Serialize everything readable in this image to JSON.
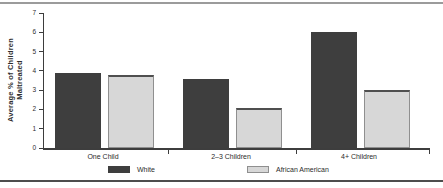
{
  "chart_data": {
    "type": "bar",
    "title": "",
    "categories": [
      "One Child",
      "2–3 Children",
      "4+ Children"
    ],
    "series": [
      {
        "name": "White",
        "values": [
          3.9,
          3.6,
          6.0
        ],
        "color": "#3e3e3e"
      },
      {
        "name": "African American",
        "values": [
          3.8,
          2.1,
          3.0
        ],
        "color": "#d7d7d7"
      }
    ],
    "xlabel": "",
    "ylabel": "Average % of Children Maltreated",
    "ylabel_line1": "Average % of Children",
    "ylabel_line2": "Maltreated",
    "ylim": [
      0,
      7
    ],
    "yticks": [
      0,
      1,
      2,
      3,
      4,
      5,
      6,
      7
    ],
    "grid": false,
    "legend_position": "bottom"
  }
}
